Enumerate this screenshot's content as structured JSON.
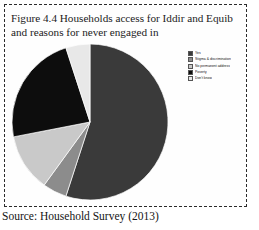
{
  "figure": {
    "title": "Figure 4.4 Households access for Iddir and Equib and reasons for never engaged in",
    "source_caption": "Source: Household Survey (2013)"
  },
  "chart_data": {
    "type": "pie",
    "title": "Figure 4.4 Households access for Iddir and Equib and reasons for never engaged in",
    "xlabel": "",
    "ylabel": "",
    "legend_position": "right",
    "grid": false,
    "categories": [
      "Yes",
      "Stigma & discrimination",
      "No permanent address",
      "Poverty",
      "Don't know"
    ],
    "values": [
      55,
      5,
      12,
      23,
      5
    ],
    "colors": [
      "#3a3a3a",
      "#8c8c8c",
      "#c9c9c9",
      "#0d0d0d",
      "#e8e8e8"
    ],
    "slices": [
      {
        "label": "Yes",
        "value": 55,
        "color": "#3a3a3a",
        "start_angle": 0,
        "end_angle": 198
      },
      {
        "label": "Stigma & discrimination",
        "value": 5,
        "color": "#8c8c8c",
        "start_angle": 198,
        "end_angle": 216
      },
      {
        "label": "No permanent address",
        "value": 12,
        "color": "#c9c9c9",
        "start_angle": 216,
        "end_angle": 259
      },
      {
        "label": "Poverty",
        "value": 23,
        "color": "#0d0d0d",
        "start_angle": 259,
        "end_angle": 342
      },
      {
        "label": "Don't know",
        "value": 5,
        "color": "#e8e8e8",
        "start_angle": 342,
        "end_angle": 360
      }
    ]
  },
  "legend": {
    "items": [
      {
        "label": "Yes",
        "color": "#3a3a3a"
      },
      {
        "label": "Stigma & discrimination",
        "color": "#8c8c8c"
      },
      {
        "label": "No permanent address",
        "color": "#c9c9c9"
      },
      {
        "label": "Poverty",
        "color": "#0d0d0d"
      },
      {
        "label": "Don't know",
        "color": "#e8e8e8"
      }
    ]
  }
}
